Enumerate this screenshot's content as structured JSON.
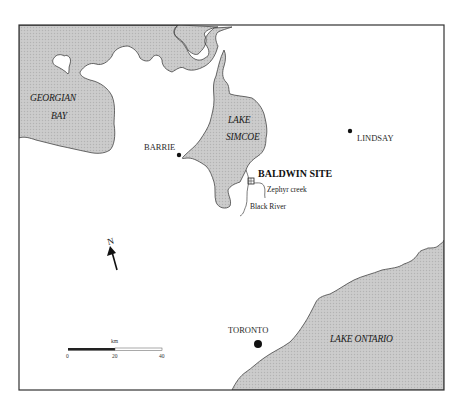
{
  "map": {
    "water_bodies": [
      {
        "name_line1": "GEORGIAN",
        "name_line2": "BAY"
      },
      {
        "name_line1": "LAKE",
        "name_line2": "SIMCOE"
      },
      {
        "name_line1": "LAKE ONTARIO"
      }
    ],
    "towns": [
      {
        "name": "BARRIE"
      },
      {
        "name": "LINDSAY"
      },
      {
        "name": "TORONTO"
      }
    ],
    "site": {
      "name": "BALDWIN SITE"
    },
    "rivers": [
      {
        "name": "Zephyr creek"
      },
      {
        "name": "Black River"
      }
    ],
    "north_arrow": {
      "label": "N"
    },
    "scale_bar": {
      "unit": "km",
      "ticks": [
        "0",
        "20",
        "40"
      ]
    },
    "colors": {
      "water": "#c8c8c8",
      "land": "#ffffff",
      "border": "#333333"
    }
  }
}
